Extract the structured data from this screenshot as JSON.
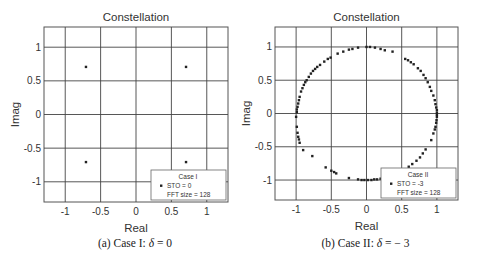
{
  "figure": {
    "panels": [
      {
        "caption_prefix": "(a) Case I:",
        "caption_symbol": "δ",
        "caption_eq": "= 0"
      },
      {
        "caption_prefix": "(b) Case II:",
        "caption_symbol": "δ",
        "caption_eq": "= − 3"
      }
    ]
  },
  "chart_data": [
    {
      "type": "scatter",
      "title": "Constellation",
      "xlabel": "Real",
      "ylabel": "Imag",
      "xlim": [
        -1.3,
        1.3
      ],
      "ylim": [
        -1.3,
        1.3
      ],
      "xticks": [
        -1,
        -0.5,
        0,
        0.5,
        1
      ],
      "xtick_labels": [
        "-1",
        "-0.5",
        "0",
        "0.5",
        "1"
      ],
      "yticks": [
        -1,
        -0.5,
        0,
        0.5,
        1
      ],
      "ytick_labels": [
        "-1",
        "-0.5",
        "0",
        "0.5",
        "1"
      ],
      "grid": true,
      "legend": {
        "position": "lower right",
        "lines": [
          "Case I",
          "STO = 0",
          "FFT size = 128"
        ]
      },
      "series": [
        {
          "name": "STO = 0",
          "points": [
            [
              -0.707,
              0.707
            ],
            [
              0.707,
              0.707
            ],
            [
              -0.707,
              -0.707
            ],
            [
              0.707,
              -0.707
            ]
          ]
        }
      ]
    },
    {
      "type": "scatter",
      "title": "Constellation",
      "xlabel": "Real",
      "ylabel": "Imag",
      "xlim": [
        -1.3,
        1.3
      ],
      "ylim": [
        -1.3,
        1.3
      ],
      "xticks": [
        -1,
        -0.5,
        0,
        0.5,
        1
      ],
      "xtick_labels": [
        "-1",
        "-0.5",
        "0",
        "0.5",
        "1"
      ],
      "yticks": [
        -1,
        -0.5,
        0,
        0.5,
        1
      ],
      "ytick_labels": [
        "-1",
        "-0.5",
        "0",
        "0.5",
        "1"
      ],
      "grid": true,
      "legend": {
        "position": "lower right",
        "lines": [
          "Case II",
          "STO = -3",
          "FFT size = 128"
        ]
      },
      "series": [
        {
          "name": "STO = -3",
          "points": [
            [
              -0.99,
              0.02
            ],
            [
              -0.99,
              0.06
            ],
            [
              -0.98,
              0.1
            ],
            [
              -0.97,
              0.15
            ],
            [
              -0.96,
              0.2
            ],
            [
              -0.95,
              0.25
            ],
            [
              -0.93,
              0.33
            ],
            [
              -0.91,
              0.38
            ],
            [
              -0.89,
              0.43
            ],
            [
              -0.87,
              0.47
            ],
            [
              -0.85,
              0.5
            ],
            [
              -0.82,
              0.55
            ],
            [
              -0.79,
              0.6
            ],
            [
              -0.76,
              0.64
            ],
            [
              -0.73,
              0.67
            ],
            [
              -0.7,
              0.7
            ],
            [
              -0.66,
              0.73
            ],
            [
              -0.6,
              0.78
            ],
            [
              -0.55,
              0.82
            ],
            [
              -0.51,
              0.84
            ],
            [
              -0.41,
              0.9
            ],
            [
              -0.33,
              0.93
            ],
            [
              -0.25,
              0.96
            ],
            [
              -0.2,
              0.97
            ],
            [
              -0.12,
              0.99
            ],
            [
              0.0,
              1.0
            ],
            [
              0.05,
              1.0
            ],
            [
              0.12,
              0.99
            ],
            [
              0.2,
              0.97
            ],
            [
              0.26,
              0.95
            ],
            [
              0.37,
              0.93
            ],
            [
              0.55,
              0.82
            ],
            [
              0.59,
              0.8
            ],
            [
              0.63,
              0.77
            ],
            [
              0.67,
              0.74
            ],
            [
              0.73,
              0.68
            ],
            [
              0.77,
              0.64
            ],
            [
              0.81,
              0.58
            ],
            [
              0.84,
              0.53
            ],
            [
              0.87,
              0.47
            ],
            [
              0.9,
              0.4
            ],
            [
              0.92,
              0.34
            ],
            [
              0.95,
              0.27
            ],
            [
              0.97,
              0.2
            ],
            [
              0.98,
              0.14
            ],
            [
              0.99,
              0.09
            ],
            [
              1.0,
              0.05
            ],
            [
              1.0,
              0.01
            ],
            [
              1.0,
              -0.02
            ],
            [
              1.0,
              -0.05
            ],
            [
              -1.0,
              -0.05
            ],
            [
              -0.99,
              -0.2
            ],
            [
              -0.98,
              -0.29
            ],
            [
              -0.97,
              -0.35
            ],
            [
              -0.96,
              -0.39
            ],
            [
              -0.95,
              -0.44
            ],
            [
              -0.9,
              -0.55
            ],
            [
              -0.77,
              -0.64
            ],
            [
              -0.58,
              -0.81
            ],
            [
              -0.5,
              -0.86
            ],
            [
              -0.46,
              -0.88
            ],
            [
              -0.43,
              -0.9
            ],
            [
              -0.25,
              -0.97
            ],
            [
              -0.12,
              -0.99
            ],
            [
              -0.07,
              -1.0
            ],
            [
              -0.03,
              -1.0
            ],
            [
              0.02,
              -1.0
            ],
            [
              0.07,
              -1.0
            ],
            [
              0.11,
              -0.99
            ],
            [
              0.15,
              -0.99
            ],
            [
              0.2,
              -0.98
            ],
            [
              0.24,
              -0.97
            ],
            [
              0.34,
              -0.94
            ],
            [
              0.38,
              -0.92
            ],
            [
              0.43,
              -0.9
            ],
            [
              0.5,
              -0.87
            ],
            [
              0.55,
              -0.84
            ],
            [
              0.6,
              -0.8
            ],
            [
              0.65,
              -0.76
            ],
            [
              0.71,
              -0.71
            ],
            [
              0.76,
              -0.66
            ],
            [
              0.8,
              -0.6
            ],
            [
              0.84,
              -0.54
            ],
            [
              0.92,
              -0.4
            ],
            [
              0.95,
              -0.3
            ],
            [
              0.97,
              -0.24
            ],
            [
              0.98,
              -0.2
            ],
            [
              0.99,
              -0.14
            ],
            [
              0.995,
              -0.1
            ]
          ]
        }
      ]
    }
  ]
}
